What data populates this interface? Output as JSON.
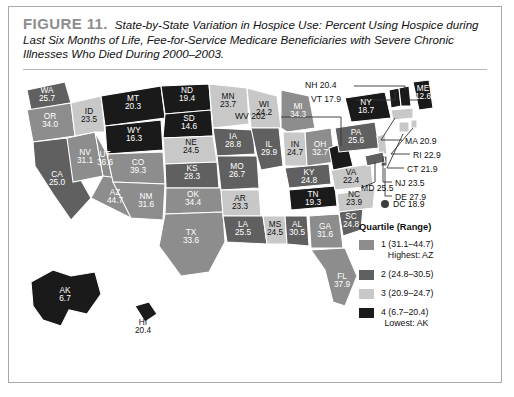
{
  "figure": {
    "number_label": "FIGURE 11.",
    "caption": "State-by-State Variation in Hospice Use: Percent Using Hospice during Last Six Months of Life, Fee-for-Service Medicare Beneficiaries with Severe Chronic Illnesses Who Died During 2000–2003."
  },
  "colors": {
    "q1": "#8d8d8d",
    "q2": "#606060",
    "q3": "#c8c8c8",
    "q4": "#1a1a1a",
    "dc_marker": "#3d3d3d",
    "figure_number": "#8d8d8d",
    "border": "#a8a8a8"
  },
  "legend": {
    "title": "Quartile (Range)",
    "items": [
      {
        "rank": "1",
        "range": "1 (31.1–44.7)",
        "note": "Highest: AZ",
        "quartile": 1
      },
      {
        "rank": "2",
        "range": "2 (24.8–30.5)",
        "note": "",
        "quartile": 2
      },
      {
        "rank": "3",
        "range": "3 (20.9–24.7)",
        "note": "",
        "quartile": 3
      },
      {
        "rank": "4",
        "range": "4 (6.7–20.4)",
        "note": "Lowest: AK",
        "quartile": 4
      }
    ]
  },
  "dc": {
    "label": "DC 18.9",
    "marker": "filled-circle"
  },
  "md": {
    "label": "MD 25.5"
  },
  "chart_data": {
    "type": "map",
    "title": "State-by-State Variation in Hospice Use",
    "unit": "percent",
    "value_range": [
      6.7,
      44.7
    ],
    "highest": "AZ",
    "lowest": "AK",
    "quartile_breaks": [
      {
        "quartile": 1,
        "min": 31.1,
        "max": 44.7
      },
      {
        "quartile": 2,
        "min": 24.8,
        "max": 30.5
      },
      {
        "quartile": 3,
        "min": 20.9,
        "max": 24.7
      },
      {
        "quartile": 4,
        "min": 6.7,
        "max": 20.4
      }
    ],
    "states": [
      {
        "code": "WA",
        "value": "25.7",
        "quartile": 2
      },
      {
        "code": "OR",
        "value": "34.0",
        "quartile": 1
      },
      {
        "code": "ID",
        "value": "23.5",
        "quartile": 3
      },
      {
        "code": "MT",
        "value": "20.3",
        "quartile": 4
      },
      {
        "code": "ND",
        "value": "19.4",
        "quartile": 4
      },
      {
        "code": "SD",
        "value": "14.6",
        "quartile": 4
      },
      {
        "code": "WY",
        "value": "16.3",
        "quartile": 4
      },
      {
        "code": "NV",
        "value": "31.1",
        "quartile": 1
      },
      {
        "code": "UT",
        "value": "36.6",
        "quartile": 1
      },
      {
        "code": "CA",
        "value": "25.0",
        "quartile": 2
      },
      {
        "code": "AZ",
        "value": "44.7",
        "quartile": 1
      },
      {
        "code": "CO",
        "value": "39.3",
        "quartile": 1
      },
      {
        "code": "NM",
        "value": "31.6",
        "quartile": 1
      },
      {
        "code": "NE",
        "value": "24.5",
        "quartile": 3
      },
      {
        "code": "KS",
        "value": "28.3",
        "quartile": 2
      },
      {
        "code": "OK",
        "value": "34.4",
        "quartile": 1
      },
      {
        "code": "TX",
        "value": "33.6",
        "quartile": 1
      },
      {
        "code": "MN",
        "value": "23.7",
        "quartile": 3
      },
      {
        "code": "IA",
        "value": "28.8",
        "quartile": 2
      },
      {
        "code": "MO",
        "value": "26.7",
        "quartile": 2
      },
      {
        "code": "AR",
        "value": "23.3",
        "quartile": 3
      },
      {
        "code": "LA",
        "value": "25.5",
        "quartile": 2
      },
      {
        "code": "WI",
        "value": "24.2",
        "quartile": 3
      },
      {
        "code": "IL",
        "value": "29.9",
        "quartile": 2
      },
      {
        "code": "MS",
        "value": "24.5",
        "quartile": 3
      },
      {
        "code": "MI",
        "value": "34.3",
        "quartile": 1
      },
      {
        "code": "IN",
        "value": "24.7",
        "quartile": 3
      },
      {
        "code": "OH",
        "value": "32.7",
        "quartile": 1
      },
      {
        "code": "KY",
        "value": "24.8",
        "quartile": 2
      },
      {
        "code": "TN",
        "value": "19.3",
        "quartile": 4
      },
      {
        "code": "AL",
        "value": "30.5",
        "quartile": 2
      },
      {
        "code": "GA",
        "value": "31.6",
        "quartile": 1
      },
      {
        "code": "FL",
        "value": "37.9",
        "quartile": 1
      },
      {
        "code": "SC",
        "value": "24.8",
        "quartile": 2
      },
      {
        "code": "NC",
        "value": "23.9",
        "quartile": 3
      },
      {
        "code": "VA",
        "value": "22.4",
        "quartile": 3
      },
      {
        "code": "PA",
        "value": "25.6",
        "quartile": 2
      },
      {
        "code": "NY",
        "value": "18.7",
        "quartile": 4
      },
      {
        "code": "ME",
        "value": "12.6",
        "quartile": 4
      },
      {
        "code": "AK",
        "value": "6.7",
        "quartile": 4
      },
      {
        "code": "HI",
        "value": "20.4",
        "quartile": 4
      },
      {
        "code": "WV",
        "value": "202",
        "quartile": 4
      },
      {
        "code": "NH",
        "value": "20.4",
        "quartile": 4
      },
      {
        "code": "VT",
        "value": "17.9",
        "quartile": 4
      },
      {
        "code": "MA",
        "value": "20.9",
        "quartile": 3
      },
      {
        "code": "RI",
        "value": "22.9",
        "quartile": 3
      },
      {
        "code": "CT",
        "value": "21.9",
        "quartile": 3
      },
      {
        "code": "NJ",
        "value": "23.5",
        "quartile": 3
      },
      {
        "code": "DE",
        "value": "27.9",
        "quartile": 2
      },
      {
        "code": "MD",
        "value": "25.5",
        "quartile": 2
      },
      {
        "code": "DC",
        "value": "18.9",
        "quartile": 4
      }
    ],
    "callout_labels": [
      {
        "text": "NH 20.4"
      },
      {
        "text": "VT 17.9"
      },
      {
        "text": "WV 202"
      },
      {
        "text": "ME 12.6"
      },
      {
        "text": "MA 20.9"
      },
      {
        "text": "RI 22.9"
      },
      {
        "text": "CT 21.9"
      },
      {
        "text": "NJ 23.5"
      },
      {
        "text": "DE 27.9"
      },
      {
        "text": "MD 25.5"
      },
      {
        "text": "DC 18.9"
      }
    ]
  }
}
